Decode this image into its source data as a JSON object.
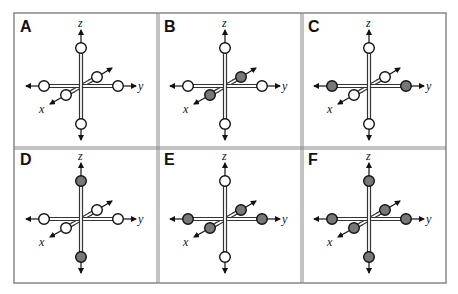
{
  "figure": {
    "grid": {
      "rows": 2,
      "cols": 3
    },
    "colors": {
      "border": "#888888",
      "axis": "#333333",
      "filled": "#777777",
      "empty": "#ffffff"
    },
    "axis_labels": {
      "x": "x",
      "y": "y",
      "z": "z"
    },
    "panels": [
      {
        "label": "A",
        "filled": {
          "x": false,
          "y": false,
          "z": false
        }
      },
      {
        "label": "B",
        "filled": {
          "x": true,
          "y": false,
          "z": false
        }
      },
      {
        "label": "C",
        "filled": {
          "x": false,
          "y": true,
          "z": false
        }
      },
      {
        "label": "D",
        "filled": {
          "x": false,
          "y": false,
          "z": true
        }
      },
      {
        "label": "E",
        "filled": {
          "x": true,
          "y": true,
          "z": false
        }
      },
      {
        "label": "F",
        "filled": {
          "x": true,
          "y": true,
          "z": true
        }
      }
    ]
  }
}
